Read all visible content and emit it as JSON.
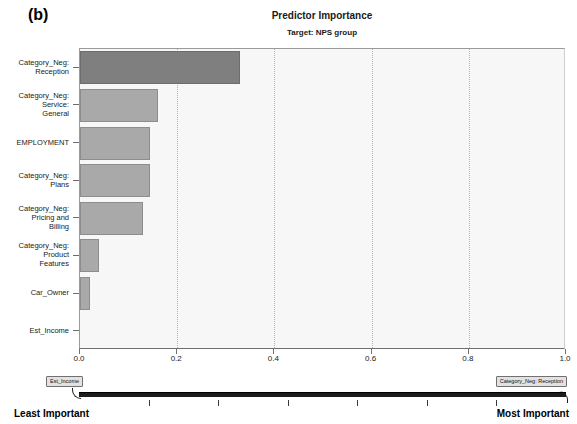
{
  "panel": {
    "label": "(b)"
  },
  "chart_data": {
    "type": "bar",
    "orientation": "horizontal",
    "title": "Predictor Importance",
    "subtitle": "Target: NPS group",
    "xlabel": "",
    "ylabel": "",
    "xlim": [
      0.0,
      1.0
    ],
    "grid": true,
    "legend": "none",
    "xticks": [
      "0.0",
      "0.2",
      "0.4",
      "0.6",
      "0.8",
      "1.0"
    ],
    "xtick_values": [
      0.0,
      0.2,
      0.4,
      0.6,
      0.8,
      1.0
    ],
    "categories": [
      "Category_Neg: Reception",
      "Category_Neg: Service: General",
      "EMPLOYMENT",
      "Category_Neg: Plans",
      "Category_Neg: Pricing and Billing",
      "Category_Neg: Product Features",
      "Car_Owner",
      "Est_Income"
    ],
    "category_lines": [
      [
        "Category_Neg:",
        "Reception"
      ],
      [
        "Category_Neg:",
        "Service:",
        "General"
      ],
      [
        "EMPLOYMENT"
      ],
      [
        "Category_Neg:",
        "Plans"
      ],
      [
        "Category_Neg:",
        "Pricing and",
        "Billing"
      ],
      [
        "Category_Neg:",
        "Product",
        "Features"
      ],
      [
        "Car_Owner"
      ],
      [
        "Est_Income"
      ]
    ],
    "values": [
      0.33,
      0.16,
      0.145,
      0.145,
      0.13,
      0.04,
      0.02,
      0.0
    ],
    "bar_colors": [
      "#7f7f7f",
      "#a9a9a9",
      "#a9a9a9",
      "#a9a9a9",
      "#a9a9a9",
      "#a9a9a9",
      "#a9a9a9",
      "#a9a9a9"
    ],
    "highlight_index": 0
  },
  "importance_slider": {
    "left_handle_label": "Est_Income",
    "right_handle_label": "Category_Neg: Reception",
    "least_label": "Least Important",
    "most_label": "Most Important",
    "tick_count": 6
  }
}
